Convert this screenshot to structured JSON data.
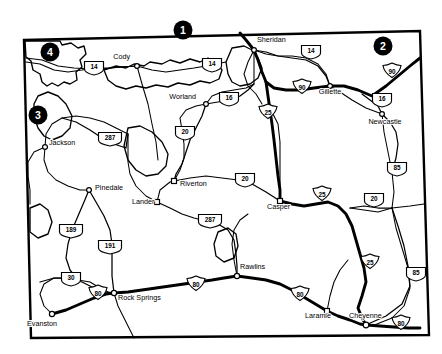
{
  "map": {
    "title": "Wyoming Highway Map",
    "region": "Wyoming",
    "background_color": "#ffffff",
    "ink_color": "#000000",
    "border_style": "rectangular state outline with notched northwest corner",
    "markers": [
      {
        "id": "marker-1",
        "label": "1",
        "x": 183,
        "y": 30,
        "position": "north edge, west of Sheridan"
      },
      {
        "id": "marker-2",
        "label": "2",
        "x": 383,
        "y": 46,
        "position": "northeast interior, above I-90"
      },
      {
        "id": "marker-3",
        "label": "3",
        "x": 38,
        "y": 115,
        "position": "west edge, north of Jackson"
      },
      {
        "id": "marker-4",
        "label": "4",
        "x": 50,
        "y": 52,
        "position": "northwest corner, Yellowstone area"
      }
    ],
    "cities": [
      {
        "name": "Cody",
        "x": 130,
        "y": 59,
        "dot_x": 137,
        "dot_y": 66,
        "anchor": "end",
        "dot": "circle"
      },
      {
        "name": "Sheridan",
        "x": 257,
        "y": 42,
        "dot_x": 254,
        "dot_y": 50,
        "anchor": "start",
        "dot": "circle"
      },
      {
        "name": "Gillette",
        "x": 330,
        "y": 94,
        "dot_x": 330,
        "dot_y": 86,
        "anchor": "middle",
        "dot": "circle"
      },
      {
        "name": "Worland",
        "x": 196,
        "y": 99,
        "dot_x": 206,
        "dot_y": 104,
        "anchor": "end",
        "dot": "circle"
      },
      {
        "name": "Newcastle",
        "x": 385,
        "y": 124,
        "dot_x": 382,
        "dot_y": 114,
        "anchor": "middle",
        "dot": "circle"
      },
      {
        "name": "Jackson",
        "x": 49,
        "y": 145,
        "dot_x": 45,
        "dot_y": 147,
        "anchor": "start",
        "dot": "circle"
      },
      {
        "name": "Pinedale",
        "x": 95,
        "y": 190,
        "dot_x": 89,
        "dot_y": 190,
        "anchor": "start",
        "dot": "circle"
      },
      {
        "name": "Riverton",
        "x": 180,
        "y": 186,
        "dot_x": 174,
        "dot_y": 181,
        "anchor": "start",
        "dot": "square"
      },
      {
        "name": "Lander",
        "x": 132,
        "y": 204,
        "dot_x": 157,
        "dot_y": 202,
        "anchor": "start",
        "dot": "square"
      },
      {
        "name": "Casper",
        "x": 267,
        "y": 209,
        "dot_x": 280,
        "dot_y": 201,
        "anchor": "start",
        "dot": "square"
      },
      {
        "name": "Rawlins",
        "x": 240,
        "y": 269,
        "dot_x": 237,
        "dot_y": 276,
        "anchor": "start",
        "dot": "circle"
      },
      {
        "name": "Rock Springs",
        "x": 118,
        "y": 300,
        "dot_x": 114,
        "dot_y": 293,
        "anchor": "start",
        "dot": "circle"
      },
      {
        "name": "Evanston",
        "x": 27,
        "y": 326,
        "dot_x": 52,
        "dot_y": 314,
        "anchor": "start",
        "dot": "circle"
      },
      {
        "name": "Laramie",
        "x": 305,
        "y": 318,
        "dot_x": 327,
        "dot_y": 311,
        "anchor": "start",
        "dot": "square"
      },
      {
        "name": "Cheyenne",
        "x": 349,
        "y": 318,
        "dot_x": 366,
        "dot_y": 325,
        "anchor": "start",
        "dot": "circle"
      }
    ],
    "shields": [
      {
        "route": "14",
        "type": "us",
        "x": 94,
        "y": 68
      },
      {
        "route": "14",
        "type": "us",
        "x": 212,
        "y": 65
      },
      {
        "route": "14",
        "type": "us",
        "x": 311,
        "y": 52
      },
      {
        "route": "90",
        "type": "interstate",
        "x": 302,
        "y": 88
      },
      {
        "route": "90",
        "type": "interstate",
        "x": 392,
        "y": 72
      },
      {
        "route": "16",
        "type": "us",
        "x": 229,
        "y": 99
      },
      {
        "route": "16",
        "type": "us",
        "x": 382,
        "y": 100
      },
      {
        "route": "25",
        "type": "interstate",
        "x": 268,
        "y": 113
      },
      {
        "route": "20",
        "type": "us",
        "x": 185,
        "y": 133
      },
      {
        "route": "287",
        "type": "us",
        "x": 110,
        "y": 139
      },
      {
        "route": "85",
        "type": "us",
        "x": 397,
        "y": 169
      },
      {
        "route": "20",
        "type": "us",
        "x": 245,
        "y": 180
      },
      {
        "route": "20",
        "type": "us",
        "x": 374,
        "y": 200
      },
      {
        "route": "25",
        "type": "interstate",
        "x": 322,
        "y": 195
      },
      {
        "route": "287",
        "type": "us",
        "x": 210,
        "y": 221
      },
      {
        "route": "189",
        "type": "us",
        "x": 71,
        "y": 231
      },
      {
        "route": "191",
        "type": "us",
        "x": 110,
        "y": 247
      },
      {
        "route": "25",
        "type": "interstate",
        "x": 370,
        "y": 263
      },
      {
        "route": "85",
        "type": "us",
        "x": 416,
        "y": 274
      },
      {
        "route": "30",
        "type": "us",
        "x": 71,
        "y": 279
      },
      {
        "route": "80",
        "type": "interstate",
        "x": 98,
        "y": 294
      },
      {
        "route": "80",
        "type": "interstate",
        "x": 196,
        "y": 285
      },
      {
        "route": "80",
        "type": "interstate",
        "x": 300,
        "y": 295
      },
      {
        "route": "80",
        "type": "interstate",
        "x": 401,
        "y": 324
      }
    ],
    "route_legend": {
      "interstate_routes": [
        "25",
        "80",
        "90"
      ],
      "us_routes": [
        "14",
        "16",
        "20",
        "30",
        "85",
        "189",
        "191",
        "287"
      ]
    }
  }
}
